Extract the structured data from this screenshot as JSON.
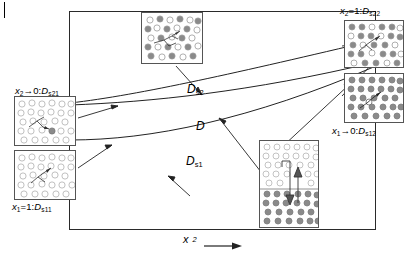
{
  "figure": {
    "type": "schematic-diagram"
  },
  "axis": {
    "x_label_var": "x",
    "x_label_sub": "2",
    "x_arrow": "right-arrow"
  },
  "curves": [
    {
      "id": "ds2",
      "label_main": "D",
      "label_sub": "s2",
      "description": "upper curve, self-diffusion of component 2"
    },
    {
      "id": "d",
      "label_main": "D",
      "label_sub": "",
      "description": "middle curve, interdiffusion coefficient"
    },
    {
      "id": "ds1",
      "label_main": "D",
      "label_sub": "s1",
      "description": "lower curve, self-diffusion of component 1"
    }
  ],
  "limits": [
    {
      "id": "top-left",
      "var": "x",
      "var_sub": "2",
      "relation": "→0:",
      "symbol": "D",
      "symbol_sub": "s21"
    },
    {
      "id": "bottom-left",
      "var": "x",
      "var_sub": "1",
      "relation": "=1:",
      "symbol": "D",
      "symbol_sub": "s11"
    },
    {
      "id": "top-right",
      "var": "x",
      "var_sub": "2",
      "relation": "=1:",
      "symbol": "D",
      "symbol_sub": "s22"
    },
    {
      "id": "bottom-right",
      "var": "x",
      "var_sub": "1",
      "relation": "→0:",
      "symbol": "D",
      "symbol_sub": "s12"
    }
  ],
  "insets": [
    {
      "id": "inset-top",
      "name": "particle-box-mixed-top",
      "style": "mixed-dark-light"
    },
    {
      "id": "inset-left1",
      "name": "particle-box-dilute-upper-left",
      "style": "mostly-light"
    },
    {
      "id": "inset-left2",
      "name": "particle-box-dilute-lower-left",
      "style": "mostly-light"
    },
    {
      "id": "inset-right1",
      "name": "particle-box-upper-right",
      "style": "mixed-dark-light"
    },
    {
      "id": "inset-right2",
      "name": "particle-box-lower-right",
      "style": "mostly-dark"
    },
    {
      "id": "inset-mid",
      "name": "particle-box-interface",
      "style": "split-light-dark"
    }
  ],
  "colors": {
    "frame": "#2a2a2a",
    "curve": "#222222",
    "dark_particle": "#8a8a8a",
    "light_particle": "#ffffff",
    "particle_outline": "#9a9a9a",
    "arrow": "#222222"
  }
}
